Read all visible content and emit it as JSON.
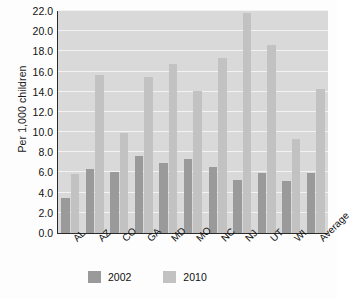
{
  "chart_data": {
    "type": "bar",
    "title": "",
    "subtitle": "",
    "xlabel": "",
    "ylabel": "Per 1,000 children",
    "ylim": [
      0.0,
      22.0
    ],
    "ytick_step": 2.0,
    "ytick_labels": [
      "22.0",
      "20.0",
      "18.0",
      "16.0",
      "14.0",
      "12.0",
      "10.0",
      "8.0",
      "6.0",
      "4.0",
      "2.0",
      "0.0"
    ],
    "ytick_values": [
      22.0,
      20.0,
      18.0,
      16.0,
      14.0,
      12.0,
      10.0,
      8.0,
      6.0,
      4.0,
      2.0,
      0.0
    ],
    "grid": true,
    "grid_axis": "y",
    "legend_position": "bottom",
    "categories": [
      "AL",
      "AZ",
      "CO",
      "GA",
      "MD",
      "MO",
      "NC",
      "NJ",
      "UT",
      "WI",
      "Average"
    ],
    "series": [
      {
        "name": "2002",
        "color": "#9a9a9a",
        "values": [
          3.5,
          6.3,
          6.0,
          7.6,
          6.9,
          7.3,
          6.5,
          5.3,
          5.9,
          5.2,
          5.9
        ]
      },
      {
        "name": "2010",
        "color": "#c2c2c2",
        "values": [
          5.8,
          15.7,
          9.9,
          15.5,
          16.7,
          14.1,
          17.3,
          21.8,
          18.6,
          9.3,
          14.3
        ]
      }
    ],
    "plot_background": "#d9d9d9",
    "gridline_color": "#f2f2f2",
    "axis_color": "#2b2b2b"
  },
  "legend": {
    "items": [
      {
        "label": "2002",
        "color": "#9a9a9a"
      },
      {
        "label": "2010",
        "color": "#c2c2c2"
      }
    ]
  }
}
